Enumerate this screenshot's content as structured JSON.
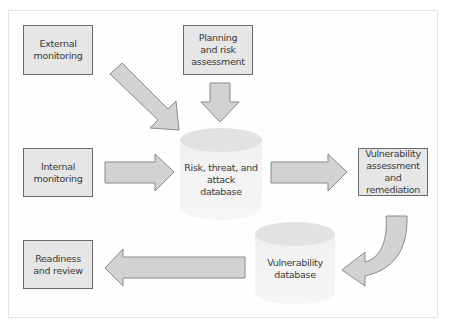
{
  "diagram": {
    "nodes": {
      "external_monitoring": "External\nmonitoring",
      "planning": "Planning\nand risk\nassessment",
      "internal_monitoring": "Internal\nmonitoring",
      "risk_db": "Risk, threat, and\nattack\ndatabase",
      "vuln_assessment": "Vulnerability\nassessment\nand remediation",
      "vuln_db": "Vulnerability\ndatabase",
      "readiness": "Readiness\nand review"
    },
    "edges": [
      {
        "from": "External monitoring",
        "to": "Risk, threat, and attack database"
      },
      {
        "from": "Planning and risk assessment",
        "to": "Risk, threat, and attack database"
      },
      {
        "from": "Internal monitoring",
        "to": "Risk, threat, and attack database"
      },
      {
        "from": "Risk, threat, and attack database",
        "to": "Vulnerability assessment and remediation"
      },
      {
        "from": "Vulnerability assessment and remediation",
        "to": "Vulnerability database"
      },
      {
        "from": "Vulnerability database",
        "to": "Readiness and review"
      }
    ],
    "colors": {
      "box_fill": "#e6e6e6",
      "box_border": "#6a6a6a",
      "arrow_fill": "#d2d2d2",
      "arrow_stroke": "#8a8a8a",
      "cylinder_top": "#e2e2e2",
      "cylinder_body": "#f1f1f1"
    }
  }
}
